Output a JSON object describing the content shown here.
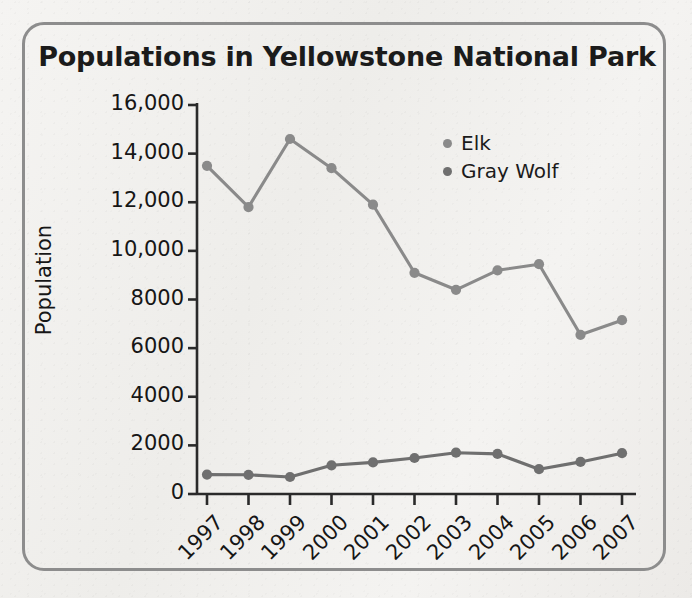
{
  "chart_data": {
    "type": "line",
    "title": "Populations in Yellowstone National Park",
    "xlabel": "",
    "ylabel": "Population",
    "categories": [
      "1997",
      "1998",
      "1999",
      "2000",
      "2001",
      "2002",
      "2003",
      "2004",
      "2005",
      "2006",
      "2007"
    ],
    "ylim": [
      0,
      16000
    ],
    "yticks": [
      0,
      2000,
      4000,
      6000,
      8000,
      10000,
      12000,
      14000,
      16000
    ],
    "ytick_labels": [
      "0",
      "2000",
      "4000",
      "6000",
      "8000",
      "10,000",
      "12,000",
      "14,000",
      "16,000"
    ],
    "grid": false,
    "legend_position": "upper right",
    "series": [
      {
        "name": "Elk",
        "color": "#8a8a8a",
        "values": [
          13500,
          11800,
          14600,
          13400,
          11900,
          9100,
          8400,
          9200,
          9450,
          6550,
          7150
        ]
      },
      {
        "name": "Gray Wolf",
        "color": "#6f6f6f",
        "values": [
          800,
          790,
          700,
          1180,
          1300,
          1480,
          1700,
          1650,
          1020,
          1320,
          1680
        ]
      }
    ]
  },
  "card": {
    "border_color": "#8d8d8d",
    "background_color": "#f2f1ef"
  },
  "axis": {
    "line_color": "#2a2a2a"
  }
}
